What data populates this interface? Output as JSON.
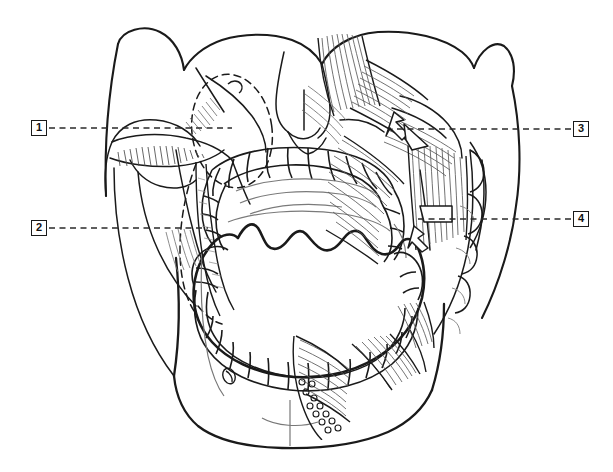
{
  "figure": {
    "type": "anatomical-line-drawing",
    "width": 613,
    "height": 472,
    "background_color": "#ffffff",
    "line_color": "#1a1a1a",
    "hatch_color": "#555555",
    "dash_color": "#333333"
  },
  "callouts": [
    {
      "id": "1",
      "label": "1",
      "side": "left",
      "box": {
        "x": 31,
        "y": 120,
        "w": 16,
        "h": 16
      },
      "leader": {
        "from_x": 49,
        "from_y": 128,
        "to_x": 232,
        "to_y": 128,
        "style": "dashed"
      }
    },
    {
      "id": "2",
      "label": "2",
      "side": "left",
      "box": {
        "x": 31,
        "y": 220,
        "w": 16,
        "h": 16
      },
      "leader": {
        "from_x": 49,
        "from_y": 228,
        "to_x": 208,
        "to_y": 228,
        "style": "dashed"
      }
    },
    {
      "id": "3",
      "label": "3",
      "side": "right",
      "box": {
        "x": 573,
        "y": 121,
        "w": 16,
        "h": 16
      },
      "leader": {
        "from_x": 571,
        "from_y": 129,
        "to_x": 392,
        "to_y": 129,
        "style": "dashed"
      }
    },
    {
      "id": "4",
      "label": "4",
      "side": "right",
      "box": {
        "x": 573,
        "y": 211,
        "w": 16,
        "h": 16
      },
      "leader": {
        "from_x": 571,
        "from_y": 219,
        "to_x": 416,
        "to_y": 219,
        "style": "dashed"
      }
    }
  ],
  "regions": [
    {
      "name": "cranium-frontal-outline",
      "description": "Upper skull contour spanning the top of the figure"
    },
    {
      "name": "left-zygomatic-arch",
      "description": "Zygomatic arch on the viewer's left, crossed by callout 1 leader"
    },
    {
      "name": "right-zygomatic-arch",
      "description": "Zygomatic arch on the viewer's right with overlying muscle fibers"
    },
    {
      "name": "nasal-aperture",
      "description": "Pear-shaped nasal opening at the midline upper face"
    },
    {
      "name": "orbit-dashed-outline",
      "description": "Dashed oval indicating the orbital cavity projection"
    },
    {
      "name": "maxillary-dental-arch",
      "description": "Upper row of teeth"
    },
    {
      "name": "mandibular-dental-arch",
      "description": "Lower row of teeth"
    },
    {
      "name": "oral-cavity",
      "description": "Open mouth aperture at the center of the figure"
    },
    {
      "name": "mandible-body",
      "description": "Lower jaw body extending to the chin"
    },
    {
      "name": "mental-foramen",
      "description": "Small oval foramen on the left mandible body"
    },
    {
      "name": "masseter-muscle",
      "description": "Hatched muscle fibers over the right ramus"
    },
    {
      "name": "temporalis-fibers",
      "description": "Vertical fiber bundles above the right zygomatic arch"
    },
    {
      "name": "buccinator-fibers",
      "description": "Horizontal fiber bundles toward the oral commissure"
    },
    {
      "name": "suprahyoid-muscles",
      "description": "Fiber bundles below the right mandible"
    },
    {
      "name": "pointer-arrow-upper",
      "description": "Arrowhead marker indicated by callout 3"
    },
    {
      "name": "pointer-arrow-lower",
      "description": "Arrowhead marker indicated by callout 4"
    }
  ]
}
